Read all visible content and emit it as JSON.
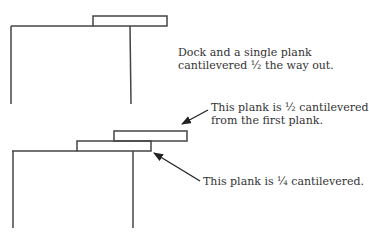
{
  "figure": {
    "top": {
      "caption_line1": "Dock and a single plank",
      "caption_line2": "cantilevered ½ the way out."
    },
    "bottom": {
      "annotation_upper_line1": "This plank is ½ cantilevered",
      "annotation_upper_line2": "from the first plank.",
      "annotation_lower": "This plank is ¼ cantilevered."
    },
    "colors": {
      "stroke": "#333333",
      "text": "#333333",
      "background": "#ffffff"
    }
  }
}
